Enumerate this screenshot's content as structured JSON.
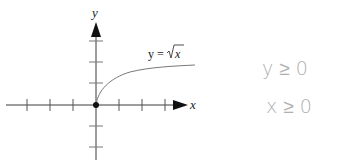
{
  "graph": {
    "x_axis_label": "x",
    "y_axis_label": "y",
    "curve_label_lhs": "y =",
    "curve_label_rad": "x",
    "function": "y = sqrt(x)",
    "origin_marker": "filled-dot",
    "x_ticks_left": 3,
    "x_ticks_right": 3,
    "y_ticks_up": 3,
    "y_ticks_down": 2
  },
  "notes": {
    "line1": "y ≥ 0",
    "line2": "x ≥ 0"
  },
  "colors": {
    "axis": "#3a3a3a",
    "tick": "#555555",
    "curve": "#777777",
    "handwriting": "#b0b0b0"
  }
}
